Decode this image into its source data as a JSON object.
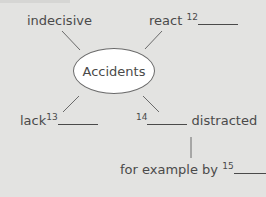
{
  "diagram": {
    "center": "Accidents",
    "nodes": [
      {
        "id": "indecisive",
        "text": "indecisive"
      },
      {
        "id": "react",
        "text": "react",
        "blank_number": "12"
      },
      {
        "id": "lack",
        "text": "lack",
        "blank_number": "13"
      },
      {
        "id": "distracted",
        "text": "distracted",
        "blank_number": "14"
      },
      {
        "id": "example",
        "text": "for example by",
        "blank_number": "15"
      }
    ]
  },
  "colors": {
    "background": "#e3e3e1",
    "text": "#4a4a4a",
    "ellipse_fill": "#ffffff"
  }
}
